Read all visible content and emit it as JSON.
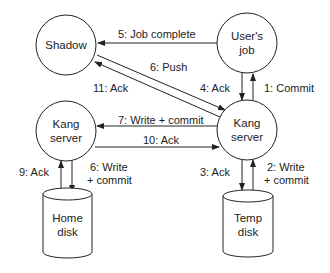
{
  "nodes": {
    "shadow": {
      "label": "Shadow"
    },
    "users_job": {
      "line1": "User's",
      "line2": "job"
    },
    "kang_left": {
      "line1": "Kang",
      "line2": "server"
    },
    "kang_right": {
      "line1": "Kang",
      "line2": "server"
    },
    "home_disk": {
      "line1": "Home",
      "line2": "disk"
    },
    "temp_disk": {
      "line1": "Temp",
      "line2": "disk"
    }
  },
  "edges": {
    "e1": {
      "label": "1: Commit"
    },
    "e2": {
      "line1": "2: Write",
      "line2": "+ commit"
    },
    "e3": {
      "label": "3: Ack"
    },
    "e4": {
      "label": "4: Ack"
    },
    "e5": {
      "label": "5: Job complete"
    },
    "e6_push": {
      "label": "6: Push"
    },
    "e6_write": {
      "line1": "6: Write",
      "line2": "+ commit"
    },
    "e7": {
      "label": "7: Write + commit"
    },
    "e9": {
      "label": "9: Ack"
    },
    "e10": {
      "label": "10: Ack"
    },
    "e11": {
      "label": "11: Ack"
    }
  }
}
